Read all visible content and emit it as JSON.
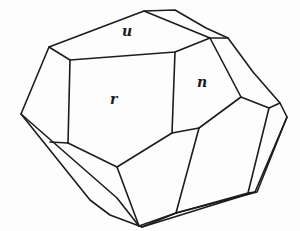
{
  "diagram": {
    "type": "crystal-drawing",
    "stroke_color": "#1c1c1c",
    "background": "#fdfdfd",
    "faces": [
      {
        "label": "u",
        "x": 122,
        "y": 33
      },
      {
        "label": "r",
        "x": 113,
        "y": 97
      },
      {
        "label": "n",
        "x": 200,
        "y": 76
      }
    ]
  }
}
